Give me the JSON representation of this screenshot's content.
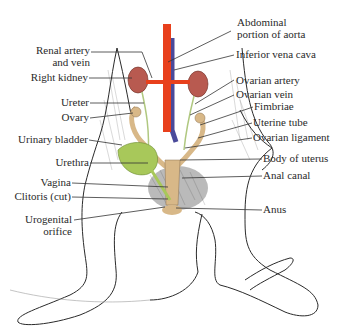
{
  "figure": {
    "left_labels": [
      {
        "id": "renal",
        "line1": "Renal artery",
        "line2": "and vein"
      },
      {
        "id": "right_kidney",
        "line1": "Right kidney"
      },
      {
        "id": "ureter",
        "line1": "Ureter"
      },
      {
        "id": "ovary",
        "line1": "Ovary"
      },
      {
        "id": "urinary_bladder",
        "line1": "Urinary bladder"
      },
      {
        "id": "urethra",
        "line1": "Urethra"
      },
      {
        "id": "vagina",
        "line1": "Vagina"
      },
      {
        "id": "clitoris",
        "line1": "Clitoris (cut)"
      },
      {
        "id": "urogenital",
        "line1": "Urogenital",
        "line2": "orifice"
      }
    ],
    "right_labels": [
      {
        "id": "aorta",
        "line1": "Abdominal",
        "line2": "portion of aorta"
      },
      {
        "id": "ivc",
        "line1": "Inferior vena cava"
      },
      {
        "id": "ovarian_artery",
        "line1": "Ovarian artery"
      },
      {
        "id": "ovarian_vein",
        "line1": "Ovarian vein"
      },
      {
        "id": "fimbriae",
        "line1": "Fimbriae"
      },
      {
        "id": "uterine_tube",
        "line1": "Uterine tube"
      },
      {
        "id": "ovarian_ligament",
        "line1": "Ovarian ligament"
      },
      {
        "id": "body_uterus",
        "line1": "Body of uterus"
      },
      {
        "id": "anal_canal",
        "line1": "Anal canal"
      },
      {
        "id": "anus",
        "line1": "Anus"
      }
    ],
    "colors": {
      "artery": "#e8401c",
      "vein": "#4a4a9a",
      "kidney": "#b85a50",
      "bladder": "#a8c85a",
      "ovary_uterus": "#d8b888",
      "outline": "#2a2a2a",
      "leader": "#333333",
      "text": "#2a2a2a"
    }
  }
}
